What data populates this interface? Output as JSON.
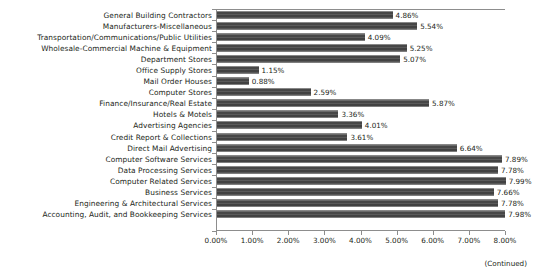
{
  "chart_data": {
    "type": "bar",
    "orientation": "horizontal",
    "title": "",
    "subtitle": "",
    "xlabel": "",
    "ylabel": "",
    "xlim": [
      0,
      8
    ],
    "xtick_labels": [
      "0.00%",
      "1.00%",
      "2.00%",
      "3.00%",
      "4.00%",
      "5.00%",
      "6.00%",
      "7.00%",
      "8.00%"
    ],
    "xtick_values": [
      0,
      1,
      2,
      3,
      4,
      5,
      6,
      7,
      8
    ],
    "grid": false,
    "legend": null,
    "value_label_format": "0.00%",
    "bar_color": "#4d4d4d",
    "axis_color": "#8d8d8d",
    "text_color": "#231f20",
    "categories": [
      "General Building Contractors",
      "Manufacturers-Miscellaneous",
      "Transportation/Communications/Public Utilities",
      "Wholesale-Commercial Machine & Equipment",
      "Department Stores",
      "Office Supply Stores",
      "Mail Order Houses",
      "Computer Stores",
      "Finance/Insurance/Real Estate",
      "Hotels & Motels",
      "Advertising Agencies",
      "Credit Report & Collections",
      "Direct Mail Advertising",
      "Computer Software Services",
      "Data Processing Services",
      "Computer Related Services",
      "Business Services",
      "Engineering & Architectural Services",
      "Accounting, Audit, and Bookkeeping Services"
    ],
    "values": [
      4.86,
      5.54,
      4.09,
      5.25,
      5.07,
      1.15,
      0.88,
      2.59,
      5.87,
      3.36,
      4.01,
      3.61,
      6.64,
      7.89,
      7.78,
      7.99,
      7.66,
      7.78,
      7.98
    ],
    "value_labels": [
      "4.86%",
      "5.54%",
      "4.09%",
      "5.25%",
      "5.07%",
      "1.15%",
      "0.88%",
      "2.59%",
      "5.87%",
      "3.36%",
      "4.01%",
      "3.61%",
      "6.64%",
      "7.89%",
      "7.78%",
      "7.99%",
      "7.66%",
      "7.78%",
      "7.98%"
    ]
  },
  "footer": {
    "continued_note": "(Continued)"
  }
}
